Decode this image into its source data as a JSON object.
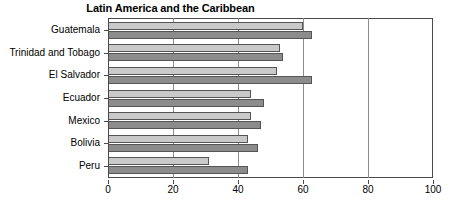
{
  "chart_data": {
    "type": "bar",
    "orientation": "horizontal",
    "title": "Latin America and the Caribbean",
    "xlabel": "",
    "ylabel": "",
    "xlim": [
      0,
      100
    ],
    "xticks": [
      0,
      20,
      40,
      60,
      80,
      100
    ],
    "xticklabels": [
      "0",
      "20",
      "40",
      "60",
      "80",
      "100"
    ],
    "grid": true,
    "grid_axis": "x",
    "legend": false,
    "categories": [
      "Guatemala",
      "Trinidad and Tobago",
      "El Salvador",
      "Ecuador",
      "Mexico",
      "Bolivia",
      "Peru"
    ],
    "series": [
      {
        "name": "light",
        "color": "#c9c9c9",
        "values": [
          60,
          53,
          52,
          44,
          44,
          43,
          31
        ]
      },
      {
        "name": "dark",
        "color": "#8c8c8c",
        "values": [
          63,
          54,
          63,
          48,
          47,
          46,
          43
        ]
      }
    ]
  },
  "colors": {
    "light_bar": "#c9c9c9",
    "dark_bar": "#8c8c8c",
    "axis": "#4a4a4a",
    "gridline": "#8d8d8d",
    "background": "#ffffff",
    "text": "#000000"
  }
}
